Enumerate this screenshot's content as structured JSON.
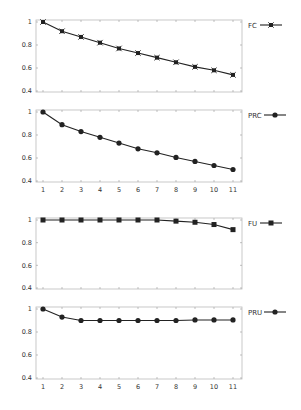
{
  "chart_data": [
    {
      "type": "line",
      "title": "",
      "xlabel": "",
      "ylabel": "",
      "x": [
        1,
        2,
        3,
        4,
        5,
        6,
        7,
        8,
        9,
        10,
        11
      ],
      "show_x_tick_labels": false,
      "yticks": [
        0.4,
        0.6,
        0.8,
        1
      ],
      "ytick_labels": [
        "0.4",
        "0.6",
        "0.8",
        "1"
      ],
      "ylim": [
        0.4,
        1.0
      ],
      "grid": false,
      "legend_position": "right-top",
      "series": [
        {
          "name": "FC",
          "marker": "square-cross",
          "values": [
            1.0,
            0.92,
            0.87,
            0.82,
            0.77,
            0.73,
            0.69,
            0.65,
            0.61,
            0.58,
            0.54
          ]
        }
      ]
    },
    {
      "type": "line",
      "title": "",
      "xlabel": "",
      "ylabel": "",
      "x": [
        1,
        2,
        3,
        4,
        5,
        6,
        7,
        8,
        9,
        10,
        11
      ],
      "show_x_tick_labels": true,
      "xtick_labels": [
        "1",
        "2",
        "3",
        "4",
        "5",
        "6",
        "7",
        "8",
        "9",
        "10",
        "11"
      ],
      "yticks": [
        0.4,
        0.6,
        0.8,
        1
      ],
      "ytick_labels": [
        "0.4",
        "0.6",
        "0.8",
        "1"
      ],
      "ylim": [
        0.4,
        1.0
      ],
      "grid": false,
      "legend_position": "right-top",
      "series": [
        {
          "name": "PRC",
          "marker": "circle",
          "values": [
            1.0,
            0.89,
            0.83,
            0.78,
            0.73,
            0.68,
            0.645,
            0.605,
            0.57,
            0.535,
            0.5
          ]
        }
      ]
    },
    {
      "type": "line",
      "title": "",
      "xlabel": "",
      "ylabel": "",
      "x": [
        1,
        2,
        3,
        4,
        5,
        6,
        7,
        8,
        9,
        10,
        11
      ],
      "show_x_tick_labels": false,
      "yticks": [
        0.4,
        0.6,
        0.8,
        1
      ],
      "ytick_labels": [
        "0.4",
        "0.6",
        "0.8",
        "1"
      ],
      "ylim": [
        0.4,
        1.0
      ],
      "grid": false,
      "legend_position": "right-top",
      "series": [
        {
          "name": "FU",
          "marker": "square",
          "values": [
            1.0,
            1.0,
            1.0,
            1.0,
            1.0,
            1.0,
            1.0,
            0.99,
            0.98,
            0.96,
            0.915
          ]
        }
      ]
    },
    {
      "type": "line",
      "title": "",
      "xlabel": "",
      "ylabel": "",
      "x": [
        1,
        2,
        3,
        4,
        5,
        6,
        7,
        8,
        9,
        10,
        11
      ],
      "show_x_tick_labels": true,
      "xtick_labels": [
        "1",
        "2",
        "3",
        "4",
        "5",
        "6",
        "7",
        "8",
        "9",
        "10",
        "11"
      ],
      "yticks": [
        0.4,
        0.6,
        0.8,
        1
      ],
      "ytick_labels": [
        "0.4",
        "0.6",
        "0.8",
        "1"
      ],
      "ylim": [
        0.4,
        1.0
      ],
      "grid": false,
      "legend_position": "right-top",
      "series": [
        {
          "name": "PRU",
          "marker": "circle",
          "values": [
            1.0,
            0.93,
            0.9,
            0.9,
            0.9,
            0.9,
            0.9,
            0.9,
            0.905,
            0.905,
            0.905
          ]
        }
      ]
    }
  ],
  "style": {
    "line_color": "#222222",
    "frame_color": "#bbbbbb",
    "text_color": "#333333",
    "background": "#ffffff"
  },
  "layout": {
    "panels": [
      {
        "top": 22,
        "bottom": 91
      },
      {
        "top": 112,
        "bottom": 181
      },
      {
        "top": 220,
        "bottom": 288
      },
      {
        "top": 309,
        "bottom": 378
      }
    ],
    "plot_left": 36,
    "plot_right": 242,
    "first_x": 43,
    "last_x": 233
  }
}
